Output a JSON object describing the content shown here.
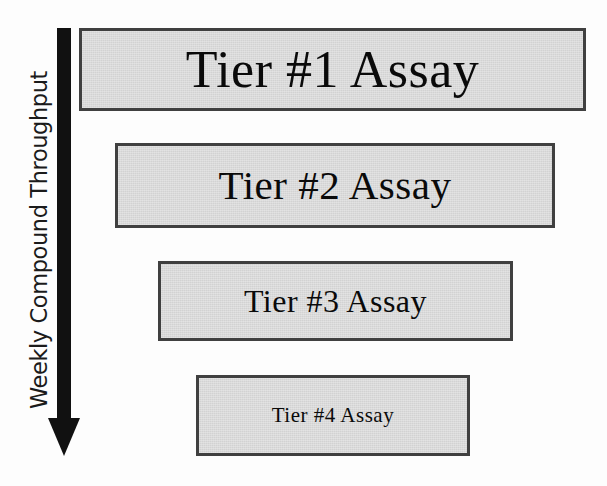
{
  "diagram": {
    "background_color": "#fdfdfd",
    "axis": {
      "label": "Weekly Compound Throughput",
      "direction": "downward",
      "arrow_color": "#111111",
      "meaning": "throughput decreases from top to bottom"
    },
    "box_style": {
      "fill_color": "#d2d2d2",
      "border_color": "#404040",
      "text_color": "#0a0a0a"
    },
    "tiers": [
      {
        "id": "tier-1",
        "label": "Tier #1 Assay",
        "rank": 1,
        "relative_width": 507,
        "font_size_px": 52
      },
      {
        "id": "tier-2",
        "label": "Tier #2 Assay",
        "rank": 2,
        "relative_width": 440,
        "font_size_px": 41
      },
      {
        "id": "tier-3",
        "label": "Tier #3 Assay",
        "rank": 3,
        "relative_width": 355,
        "font_size_px": 32
      },
      {
        "id": "tier-4",
        "label": "Tier #4 Assay",
        "rank": 4,
        "relative_width": 274,
        "font_size_px": 21
      }
    ]
  }
}
